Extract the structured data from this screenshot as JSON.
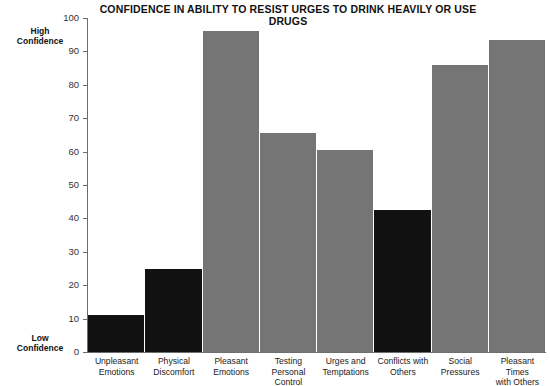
{
  "chart_data": {
    "type": "bar",
    "title": "CONFIDENCE IN ABILITY TO RESIST URGES TO DRINK HEAVILY OR USE DRUGS",
    "xlabel": "",
    "ylabel": "",
    "ylim": [
      0,
      100
    ],
    "grid": false,
    "legend": false,
    "y_ticks": [
      0,
      10,
      20,
      30,
      40,
      50,
      60,
      70,
      80,
      90,
      100
    ],
    "y_axis_annotations": {
      "top": "High\nConfidence",
      "top_line1": "High",
      "top_line2": "Confidence",
      "bottom_line1": "Low",
      "bottom_line2": "Confidence"
    },
    "categories": [
      "Unpleasant Emotions",
      "Physical Discomfort",
      "Pleasant Emotions",
      "Testing Personal Control",
      "Urges and Temptations",
      "Conflicts with Others",
      "Social Pressures",
      "Pleasant Times with Others"
    ],
    "category_labels": [
      {
        "line1": "Unpleasant",
        "line2": "Emotions"
      },
      {
        "line1": "Physical",
        "line2": "Discomfort"
      },
      {
        "line1": "Pleasant",
        "line2": "Emotions"
      },
      {
        "line1": "Testing Personal",
        "line2": "Control"
      },
      {
        "line1": "Urges and",
        "line2": "Temptations"
      },
      {
        "line1": "Conflicts with",
        "line2": "Others"
      },
      {
        "line1": "Social Pressures",
        "line2": ""
      },
      {
        "line1": "Pleasant Times",
        "line2": "with Others"
      }
    ],
    "values": [
      11,
      25,
      96,
      65.5,
      60.5,
      42.5,
      86,
      93.5
    ],
    "bar_colors": [
      "#111111",
      "#111111",
      "#757575",
      "#757575",
      "#757575",
      "#111111",
      "#757575",
      "#757575"
    ]
  },
  "colors": {
    "bar_gray": "#757575",
    "bar_dark": "#111111",
    "axis": "#6e6e6e",
    "text": "#1a1a1a",
    "background": "#ffffff"
  }
}
